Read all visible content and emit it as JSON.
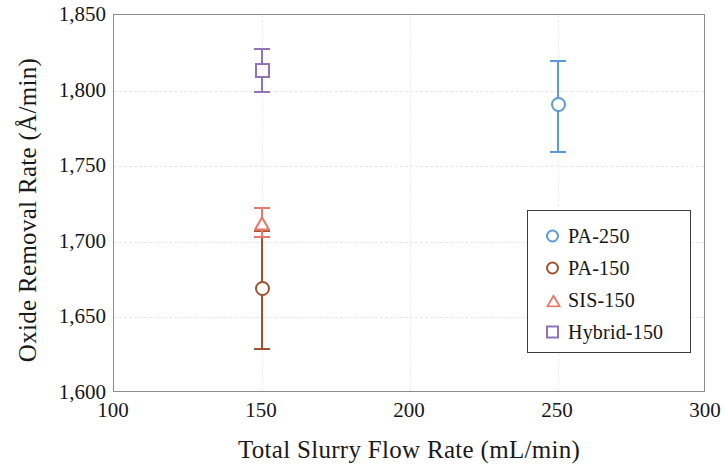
{
  "chart_data": {
    "type": "scatter",
    "title": "",
    "xlabel": "Total Slurry Flow Rate (mL/min)",
    "ylabel": "Oxide Removal Rate (Å/min)",
    "xlim": [
      100,
      300
    ],
    "ylim": [
      1600,
      1850
    ],
    "xticks": [
      100,
      150,
      200,
      250,
      300
    ],
    "xtick_labels": [
      "100",
      "150",
      "200",
      "250",
      "300"
    ],
    "yticks": [
      1600,
      1650,
      1700,
      1750,
      1800,
      1850
    ],
    "ytick_labels": [
      "1,600",
      "1,650",
      "1,700",
      "1,750",
      "1,800",
      "1,850"
    ],
    "grid": true,
    "legend_position": "lower right",
    "error_bars": "vertical",
    "series": [
      {
        "name": "PA-250",
        "marker": "circle",
        "color": "#5B9BD5",
        "x": [
          250
        ],
        "y": [
          1791
        ],
        "yerr_low": [
          1760
        ],
        "yerr_high": [
          1820
        ]
      },
      {
        "name": "PA-150",
        "marker": "circle",
        "color": "#A0522D",
        "x": [
          150
        ],
        "y": [
          1669
        ],
        "yerr_low": [
          1630
        ],
        "yerr_high": [
          1708
        ]
      },
      {
        "name": "SIS-150",
        "marker": "triangle",
        "color": "#E8796A",
        "x": [
          150
        ],
        "y": [
          1712
        ],
        "yerr_low": [
          1704
        ],
        "yerr_high": [
          1723
        ]
      },
      {
        "name": "Hybrid-150",
        "marker": "square",
        "color": "#9273B8",
        "x": [
          150
        ],
        "y": [
          1813
        ],
        "yerr_low": [
          1800
        ],
        "yerr_high": [
          1828
        ]
      }
    ]
  },
  "legend": {
    "items": [
      {
        "label": "PA-250",
        "marker": "circle",
        "color": "#5B9BD5"
      },
      {
        "label": "PA-150",
        "marker": "circle",
        "color": "#A0522D"
      },
      {
        "label": "SIS-150",
        "marker": "triangle",
        "color": "#E8796A"
      },
      {
        "label": "Hybrid-150",
        "marker": "square",
        "color": "#9273B8"
      }
    ]
  },
  "style": {
    "frame_color": "#8c8c8c",
    "grid_color": "#e6e6ea",
    "text_color": "#1a1a1a",
    "background": "#ffffff"
  }
}
